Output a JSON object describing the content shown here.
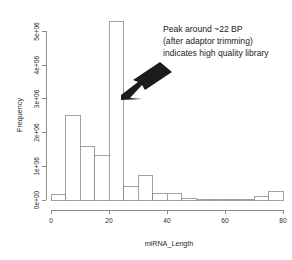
{
  "chart_data": {
    "type": "bar",
    "title": "",
    "subtitle": "",
    "xlabel": "miRNA_Length",
    "ylabel": "Frequency",
    "xlim": [
      0,
      80
    ],
    "ylim": [
      0,
      5400000
    ],
    "grid": false,
    "legend": null,
    "bin_width": 5,
    "categories": [
      "0-5",
      "5-10",
      "10-15",
      "15-20",
      "20-25",
      "25-30",
      "30-35",
      "35-40",
      "40-45",
      "45-50",
      "50-55",
      "55-60",
      "60-65",
      "65-70",
      "70-75",
      "75-80"
    ],
    "bin_starts": [
      0,
      5,
      10,
      15,
      20,
      25,
      30,
      35,
      40,
      45,
      50,
      55,
      60,
      65,
      70,
      75
    ],
    "bin_ends": [
      5,
      10,
      15,
      20,
      25,
      30,
      35,
      40,
      45,
      50,
      55,
      60,
      65,
      70,
      75,
      80
    ],
    "values": [
      170000,
      2500000,
      1580000,
      1330000,
      5300000,
      400000,
      720000,
      200000,
      200000,
      55000,
      20000,
      15000,
      12000,
      10000,
      90000,
      240000
    ],
    "xticks": [
      0,
      20,
      40,
      60,
      80
    ],
    "xtick_labels": [
      "0",
      "20",
      "40",
      "60",
      "80"
    ],
    "yticks": [
      0,
      1000000,
      2000000,
      3000000,
      4000000,
      5000000
    ],
    "ytick_labels": [
      "0e+00",
      "1e+06",
      "2e+06",
      "3e+06",
      "4e+06",
      "5e+06"
    ],
    "annotations": [
      {
        "name": "peak-callout",
        "lines": [
          "Peak around ~22 BP",
          "(after adaptor trimming)",
          "indicates high quality library"
        ],
        "arrow": "down-left-arrow pointing at 20-25 bin peak"
      }
    ]
  }
}
